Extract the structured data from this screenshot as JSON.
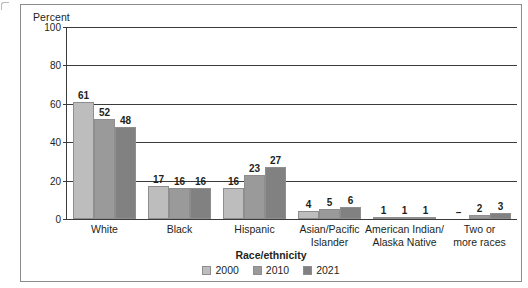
{
  "figure": {
    "y_axis_title": "Percent",
    "x_axis_title": "Race/ethnicity"
  },
  "legend": {
    "title": "Race/ethnicity",
    "entries": [
      {
        "label": "2000",
        "color": "#bdbdbd"
      },
      {
        "label": "2010",
        "color": "#9a9a9a"
      },
      {
        "label": "2021",
        "color": "#818181"
      }
    ]
  },
  "chart_data": {
    "type": "bar",
    "title": "",
    "xlabel": "Race/ethnicity",
    "ylabel": "Percent",
    "ylim": [
      0,
      100
    ],
    "yticks": [
      0,
      20,
      40,
      60,
      80,
      100
    ],
    "ytick_labels": [
      "0",
      "20",
      "40",
      "60",
      "80",
      "100"
    ],
    "grid": "horizontal",
    "legend_position": "bottom-center",
    "categories": [
      "White",
      "Black",
      "Hispanic",
      "Asian/Pacific Islander",
      "American Indian/ Alaska Native",
      "Two or more races"
    ],
    "category_lines": [
      [
        "White"
      ],
      [
        "Black"
      ],
      [
        "Hispanic"
      ],
      [
        "Asian/Pacific",
        "Islander"
      ],
      [
        "American Indian/",
        "Alaska Native"
      ],
      [
        "Two or",
        "more races"
      ]
    ],
    "series": [
      {
        "name": "2000",
        "color": "#bdbdbd",
        "values": [
          61,
          17,
          16,
          4,
          1,
          null
        ],
        "labels": [
          "61",
          "17",
          "16",
          "4",
          "1",
          "–"
        ]
      },
      {
        "name": "2010",
        "color": "#9a9a9a",
        "values": [
          52,
          16,
          23,
          5,
          1,
          2
        ],
        "labels": [
          "52",
          "16",
          "23",
          "5",
          "1",
          "2"
        ]
      },
      {
        "name": "2021",
        "color": "#818181",
        "values": [
          48,
          16,
          27,
          6,
          1,
          3
        ],
        "labels": [
          "48",
          "16",
          "27",
          "6",
          "1",
          "3"
        ]
      }
    ]
  }
}
